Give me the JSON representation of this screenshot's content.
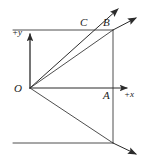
{
  "figure": {
    "kind": "geometry-diagram",
    "width": 146,
    "height": 162,
    "background_color": "#ffffff",
    "line_color": "#3a3a3a",
    "label_color": "#1a1a1a"
  },
  "labels": {
    "point_c": "C",
    "point_b": "B",
    "point_a": "A",
    "origin": "O",
    "axis_y": "+y",
    "axis_x": "+x"
  },
  "geometry": {
    "origin": {
      "x": 30,
      "y": 88
    },
    "points": {
      "A": {
        "x": 113,
        "y": 88
      },
      "B": {
        "x": 113,
        "y": 30
      },
      "C": {
        "x": 83,
        "y": 30
      },
      "D": {
        "x": 113,
        "y": 143
      }
    },
    "rays": [
      {
        "name": "ray-through-c",
        "from": [
          30,
          88
        ],
        "to": [
          121,
          6
        ],
        "arrow": true
      },
      {
        "name": "ray-through-b",
        "from": [
          30,
          88
        ],
        "to": [
          139,
          16
        ],
        "arrow": true
      },
      {
        "name": "ray-down-right",
        "from": [
          30,
          88
        ],
        "to": [
          139,
          156
        ],
        "arrow": true
      },
      {
        "name": "axis-y-positive",
        "from": [
          30,
          88
        ],
        "to": [
          30,
          32
        ],
        "arrow": true
      },
      {
        "name": "axis-x-positive",
        "from": [
          30,
          88
        ],
        "to": [
          130,
          88
        ],
        "arrow": true
      }
    ],
    "segments": [
      {
        "name": "top-horizontal-line",
        "from": [
          13,
          30
        ],
        "to": [
          113,
          30
        ]
      },
      {
        "name": "bottom-horizontal-line",
        "from": [
          13,
          143
        ],
        "to": [
          113,
          143
        ]
      },
      {
        "name": "right-vertical-line",
        "from": [
          113,
          30
        ],
        "to": [
          113,
          143
        ]
      }
    ]
  }
}
